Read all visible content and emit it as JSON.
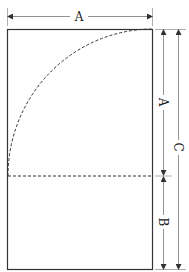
{
  "diagram": {
    "type": "golden-rectangle-construction",
    "labels": {
      "top_width": "A",
      "right_upper": "A",
      "right_lower": "B",
      "right_total": "C"
    },
    "colors": {
      "stroke": "#333333",
      "dim_line": "#777777",
      "background": "#ffffff"
    }
  }
}
